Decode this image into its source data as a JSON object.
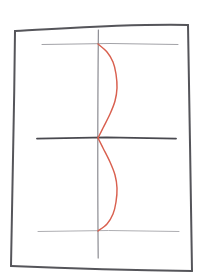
{
  "canvas": {
    "width": 206,
    "height": 279,
    "background_color": "#ffffff",
    "description": "hand-drawn-sketch-of-curve-on-axes"
  },
  "chart_data": {
    "type": "line",
    "title": "",
    "subtitle": "",
    "xlabel": "",
    "ylabel": "",
    "style": "hand-drawn-sketch",
    "grid": true,
    "legend": null,
    "annotations": [],
    "categories": [],
    "tick_labels": {
      "x": [],
      "y": []
    },
    "axes": {
      "vertical_axis_x": 98,
      "horizontal_axis_y": 138,
      "top_gridline_y": 44,
      "bottom_gridline_y": 231,
      "xlim": [
        14,
        189
      ],
      "ylim": [
        28,
        269
      ]
    },
    "series": [
      {
        "name": "red-curve",
        "color": "#d9604f",
        "shape": "two-symmetric-right-bulging-lobes",
        "points": [
          {
            "x": 98,
            "y": 44
          },
          {
            "x": 107,
            "y": 52
          },
          {
            "x": 113,
            "y": 62
          },
          {
            "x": 116,
            "y": 74
          },
          {
            "x": 117,
            "y": 88
          },
          {
            "x": 115,
            "y": 101
          },
          {
            "x": 110,
            "y": 114
          },
          {
            "x": 103,
            "y": 128
          },
          {
            "x": 98,
            "y": 138
          },
          {
            "x": 103,
            "y": 148
          },
          {
            "x": 110,
            "y": 162
          },
          {
            "x": 115,
            "y": 175
          },
          {
            "x": 117,
            "y": 188
          },
          {
            "x": 116,
            "y": 202
          },
          {
            "x": 113,
            "y": 214
          },
          {
            "x": 107,
            "y": 224
          },
          {
            "x": 98,
            "y": 231
          }
        ]
      }
    ]
  },
  "frame": {
    "name": "hand-drawn-border",
    "color": "#55555a",
    "corners": {
      "top_left": {
        "x": 15,
        "y": 31
      },
      "top_right": {
        "x": 188,
        "y": 25
      },
      "bottom_right": {
        "x": 192,
        "y": 271
      },
      "bottom_left": {
        "x": 11,
        "y": 266
      }
    }
  },
  "gridlines": {
    "top": {
      "name": "top-gridline",
      "color": "#9a9a9f",
      "y": 44,
      "x_start": 42,
      "x_end": 178
    },
    "middle": {
      "name": "horizontal-axis",
      "color": "#4a4a50",
      "y": 138,
      "x_start": 37,
      "x_end": 176
    },
    "bottom": {
      "name": "bottom-gridline",
      "color": "#a5a5aa",
      "y": 231,
      "x_start": 38,
      "x_end": 179
    },
    "vertical": {
      "name": "vertical-axis",
      "color": "#8a8a90",
      "x": 98,
      "y_start": 30,
      "y_end": 258
    }
  }
}
